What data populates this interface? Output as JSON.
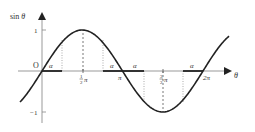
{
  "diagram": {
    "axes": {
      "y_label": "sin θ",
      "x_label": "θ",
      "origin_label": "O",
      "y_ticks": [
        {
          "value": 1,
          "label": "1"
        },
        {
          "value": -1,
          "label": "−1"
        }
      ],
      "x_ticks": [
        {
          "value": "π/2",
          "label_num": "1",
          "label_den": "2",
          "label_sym": "π"
        },
        {
          "value": "π",
          "label": "π"
        },
        {
          "value": "3π/2",
          "label_num": "3",
          "label_den": "2",
          "label_sym": "π"
        },
        {
          "value": "2π",
          "label": "2π"
        }
      ]
    },
    "angle_labels": [
      "α",
      "α",
      "α",
      "α"
    ],
    "colors": {
      "curve": "#222222",
      "axis": "#888888",
      "alpha_segment": "#333333",
      "guide": "#777777"
    }
  },
  "chart_data": {
    "type": "line",
    "title": "",
    "xlabel": "θ",
    "ylabel": "sin θ",
    "ylim": [
      -1,
      1
    ],
    "x": [
      "0",
      "π/2",
      "π",
      "3π/2",
      "2π"
    ],
    "series": [
      {
        "name": "sin θ",
        "values": [
          0,
          1,
          0,
          -1,
          0
        ]
      }
    ],
    "annotations": [
      "α marked on θ-axis from 0 to α",
      "α marked from π−α to π",
      "α marked from π to π+α",
      "α marked from 2π−α to 2π",
      "dashed vertical guides at π/2 and 3π/2",
      "dotted vertical guides at α, π−α, π+α, 2π−α"
    ],
    "grid": false
  }
}
